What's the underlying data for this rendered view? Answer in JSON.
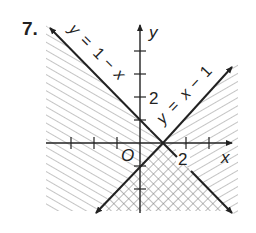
{
  "problem_number": "7.",
  "axes": {
    "x_label": "x",
    "y_label": "y",
    "origin_label": "O",
    "x_tick_label": "2",
    "y_tick_label": "2"
  },
  "lines": [
    {
      "equation": "y = 1 − x",
      "label_parts": [
        "y",
        "=",
        "1",
        "−",
        "x"
      ]
    },
    {
      "equation": "y = x − 1",
      "label_parts": [
        "y",
        "=",
        "x",
        "−",
        "1"
      ]
    }
  ],
  "regions": {
    "left_hatched": "y ≤ 1 − x, x ≤ 1 side (single hatch)",
    "right_hatched": "y ≤ x − 1 side (single hatch)",
    "bottom_crosshatched": "both inequalities (cross hatch)"
  },
  "colors": {
    "ink": "#222222",
    "hatch": "#888888",
    "background": "#ffffff"
  }
}
